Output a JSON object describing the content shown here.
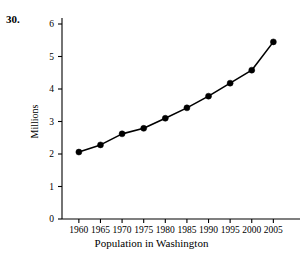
{
  "problem": {
    "number": "30."
  },
  "chart_data": {
    "type": "line",
    "title": "",
    "xlabel": "Population in Washington",
    "ylabel": "Millions",
    "x": [
      1960,
      1965,
      1970,
      1975,
      1980,
      1985,
      1990,
      1995,
      2000,
      2005
    ],
    "xtick_labels": [
      "1960",
      "1965",
      "1970",
      "1975",
      "1980",
      "1985",
      "1990",
      "1995",
      "2000",
      "2005"
    ],
    "values": [
      2.06,
      2.28,
      2.62,
      2.79,
      3.1,
      3.42,
      3.78,
      4.18,
      4.58,
      5.45
    ],
    "ytick_labels": [
      "0",
      "1",
      "2",
      "3",
      "4",
      "5",
      "6"
    ],
    "yticks": [
      0,
      1,
      2,
      3,
      4,
      5,
      6
    ],
    "ylim": [
      0,
      6.3
    ],
    "xlim": [
      1957.5,
      2007.5
    ],
    "grid": false,
    "legend": "none",
    "marker": "filled-circle",
    "line_color": "#000000",
    "marker_color": "#000000",
    "axis_color": "#000000",
    "background_color": "#ffffff"
  }
}
